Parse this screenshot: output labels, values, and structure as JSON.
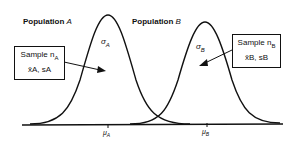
{
  "population_a": {
    "label": "Population",
    "name": "A",
    "sigma": "σ",
    "sigma_sub": "A",
    "mu": "μ",
    "mu_sub": "A"
  },
  "population_b": {
    "label": "Population",
    "name": "B",
    "sigma": "σ",
    "sigma_sub": "B",
    "mu": "μ",
    "mu_sub": "B"
  },
  "sample_a": {
    "line1": "Sample n",
    "line1_sub": "A",
    "line2": "x̄A, sA"
  },
  "sample_b": {
    "line1": "Sample n",
    "line1_sub": "B",
    "line2": "x̄B, sB"
  }
}
